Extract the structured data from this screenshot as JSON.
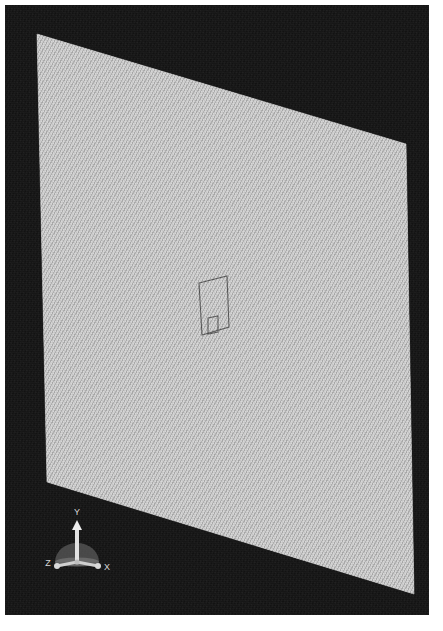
{
  "app": {
    "title": "3D Model Viewport",
    "kind": "cad-viewport"
  },
  "viewport": {
    "background_color": "#161616",
    "surface_color": "#cdcdcd",
    "edge_color": "#6b6b6b",
    "label": "render-canvas"
  },
  "geometry": {
    "plane": {
      "name": "shaded-plane-surface",
      "fill": "#cdcdcd",
      "points": "32,29 401,139 409,589 42,477"
    },
    "feature": {
      "name": "rectangular-cutout-feature",
      "outline": "194,278 222,271 224,322 197,330",
      "notch": "203,313 213,311 213,327 203,329",
      "stroke": "#5d5d5d"
    }
  },
  "axis_triad": {
    "name": "orientation-axis-triad",
    "origin_color": "#b8b8b8",
    "axes": [
      {
        "id": "y",
        "label": "Y",
        "direction": "up",
        "color": "#e2e2e2"
      },
      {
        "id": "x",
        "label": "X",
        "direction": "right",
        "color": "#cfcfcf"
      },
      {
        "id": "z",
        "label": "Z",
        "direction": "left",
        "color": "#cfcfcf"
      }
    ]
  }
}
